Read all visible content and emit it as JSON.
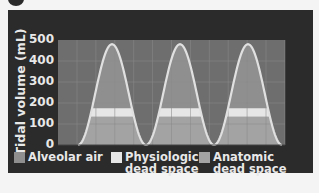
{
  "chart_data": {
    "type": "area",
    "title": "",
    "xlabel": "",
    "ylabel": "Tidal volume (mL)",
    "ylim": [
      0,
      500
    ],
    "yticks": [
      0,
      100,
      200,
      300,
      400,
      500
    ],
    "grid": true,
    "cycles": 3,
    "peak_volume": 480,
    "series": [
      {
        "name": "Alveolar air",
        "range": [
          175,
          480
        ],
        "color": "#8f8f8f"
      },
      {
        "name": "Physiologic dead space",
        "range": [
          135,
          175
        ],
        "color": "#e6e6e6"
      },
      {
        "name": "Anatomic dead space",
        "range": [
          0,
          135
        ],
        "color": "#a3a3a3"
      }
    ],
    "legend": {
      "position": "bottom"
    }
  },
  "axis": {
    "ylabel": "Tidal volume (mL)",
    "ticks": [
      "500",
      "400",
      "300",
      "200",
      "100",
      "0"
    ]
  },
  "legend": [
    {
      "label": "Alveolar air",
      "color": "#8f8f8f"
    },
    {
      "label": "Physiologic dead space",
      "color": "#e6e6e6"
    },
    {
      "label": "Anatomic dead space",
      "color": "#a3a3a3"
    }
  ],
  "colors": {
    "panel": "#2b2b2b",
    "plot_bg": "#6e6e6e",
    "grid": "#8a8a8a",
    "curve": "#e0e0e0"
  }
}
